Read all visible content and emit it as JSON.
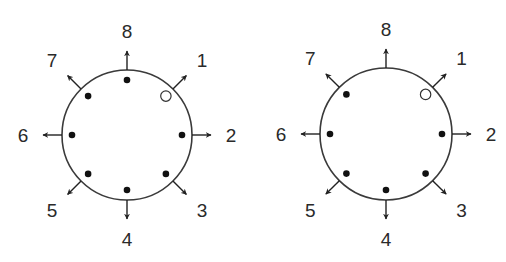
{
  "figure": {
    "colors": {
      "stroke": "#3a3a3a",
      "dot": "#111111",
      "label": "#2a2a2a",
      "background": "#ffffff"
    }
  },
  "diagrams": [
    {
      "id": "left",
      "center": [
        127,
        135
      ],
      "radius": 65,
      "directions": [
        {
          "label": "1",
          "angle": 45,
          "marker": "open"
        },
        {
          "label": "2",
          "angle": 0,
          "marker": "filled"
        },
        {
          "label": "3",
          "angle": -45,
          "marker": "filled"
        },
        {
          "label": "4",
          "angle": -90,
          "marker": "filled"
        },
        {
          "label": "5",
          "angle": -135,
          "marker": "filled"
        },
        {
          "label": "6",
          "angle": 180,
          "marker": "filled"
        },
        {
          "label": "7",
          "angle": 135,
          "marker": "filled"
        },
        {
          "label": "8",
          "angle": 90,
          "marker": "filled"
        }
      ]
    },
    {
      "id": "right",
      "center": [
        386,
        134
      ],
      "radius": 66,
      "directions": [
        {
          "label": "1",
          "angle": 45,
          "marker": "open"
        },
        {
          "label": "2",
          "angle": 0,
          "marker": "filled"
        },
        {
          "label": "3",
          "angle": -45,
          "marker": "filled"
        },
        {
          "label": "4",
          "angle": -90,
          "marker": "filled"
        },
        {
          "label": "5",
          "angle": -135,
          "marker": "filled"
        },
        {
          "label": "6",
          "angle": 180,
          "marker": "filled"
        },
        {
          "label": "7",
          "angle": 135,
          "marker": "filled"
        },
        {
          "label": "8",
          "angle": 90,
          "marker": "none"
        }
      ]
    }
  ]
}
